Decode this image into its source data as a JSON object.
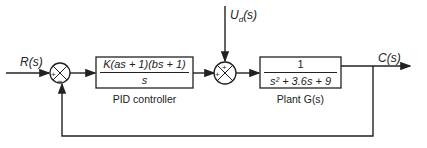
{
  "diagram": {
    "type": "feedback-control-block-diagram",
    "input_label": "R(s)",
    "disturbance_label": "U_d(s)",
    "output_label": "C(s)",
    "summing_junction_1": {
      "plus": "+",
      "minus": "−"
    },
    "summing_junction_2": {
      "plus_top": "+",
      "plus_left": "+"
    },
    "controller": {
      "numerator": "K(as + 1)(bs + 1)",
      "denominator": "s",
      "caption": "PID controller"
    },
    "plant": {
      "numerator": "1",
      "denominator": "s² + 3.6s + 9",
      "caption": "Plant G(s)"
    },
    "line_color": "#222222"
  }
}
